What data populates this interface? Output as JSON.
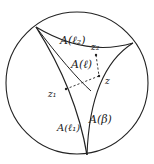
{
  "diagram": {
    "type": "hyperbolic-disk",
    "colors": {
      "ink": "#222222",
      "background": "#ffffff"
    },
    "labels": {
      "region_l2": "A(ℓ₂)",
      "region_l": "A(ℓ)",
      "region_l1": "A(ℓ₁)",
      "region_beta": "A(β)",
      "point_z": "z",
      "point_z1": "z₁",
      "point_z2": "z₂"
    }
  }
}
